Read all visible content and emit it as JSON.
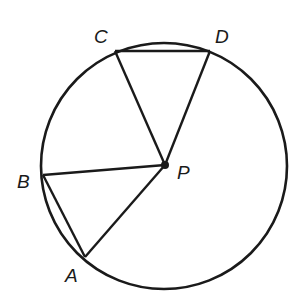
{
  "diagram": {
    "type": "circle-geometry",
    "circle": {
      "cx": 164,
      "cy": 166,
      "r": 123
    },
    "center": {
      "label": "P",
      "x": 165,
      "y": 165
    },
    "points": [
      {
        "label": "A",
        "x": 85,
        "y": 257,
        "label_x": 65,
        "label_y": 282
      },
      {
        "label": "B",
        "x": 43,
        "y": 175,
        "label_x": 17,
        "label_y": 188
      },
      {
        "label": "C",
        "x": 115,
        "y": 51,
        "label_x": 94,
        "label_y": 43
      },
      {
        "label": "D",
        "x": 210,
        "y": 51,
        "label_x": 215,
        "label_y": 43
      }
    ],
    "segments": [
      [
        "P",
        "A"
      ],
      [
        "P",
        "B"
      ],
      [
        "P",
        "C"
      ],
      [
        "P",
        "D"
      ],
      [
        "A",
        "B"
      ],
      [
        "C",
        "D"
      ]
    ],
    "labels": {
      "A": "A",
      "B": "B",
      "C": "C",
      "D": "D",
      "P": "P"
    },
    "stroke_color": "#1a1a1a"
  }
}
